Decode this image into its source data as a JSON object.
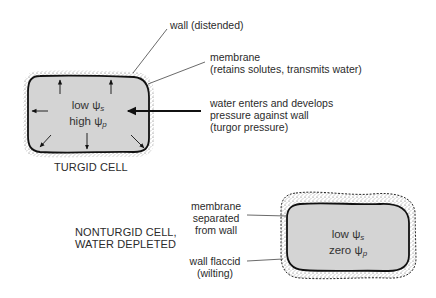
{
  "turgid_cell": {
    "caption": "TURGID CELL",
    "inner_line1_prefix": "low ",
    "inner_line1_symbol": "ψ",
    "inner_line1_sub": "s",
    "inner_line2_prefix": "high ",
    "inner_line2_symbol": "ψ",
    "inner_line2_sub": "p",
    "labels": {
      "wall": "wall (distended)",
      "membrane_line1": "membrane",
      "membrane_line2": "(retains solutes, transmits water)",
      "water_line1": "water enters and develops",
      "water_line2": "pressure against wall",
      "water_line3": "(turgor pressure)"
    }
  },
  "nonturgid_cell": {
    "caption_line1": "NONTURGID CELL,",
    "caption_line2": "WATER DEPLETED",
    "inner_line1_prefix": "low ",
    "inner_line1_symbol": "ψ",
    "inner_line1_sub": "s",
    "inner_line2_prefix": "zero ",
    "inner_line2_symbol": "ψ",
    "inner_line2_sub": "p",
    "labels": {
      "membrane_line1": "membrane",
      "membrane_line2": "separated",
      "membrane_line3": "from wall",
      "wall_line1": "wall flaccid",
      "wall_line2": "(wilting)"
    }
  },
  "colors": {
    "cell_fill": "#d4d4d4",
    "outline": "#111111",
    "stipple": "#555555",
    "leader": "#444444"
  }
}
